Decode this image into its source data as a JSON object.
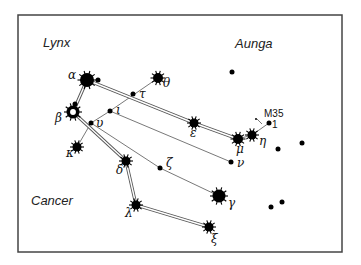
{
  "frame": {
    "x": 18,
    "y": 15,
    "w": 324,
    "h": 237,
    "stroke": "#444444"
  },
  "constellations": [
    {
      "label": "Lynx",
      "x": 43,
      "y": 47
    },
    {
      "label": "Aunga",
      "x": 235,
      "y": 48
    },
    {
      "label": "Cancer",
      "x": 31,
      "y": 205
    }
  ],
  "stars": [
    {
      "id": "theta",
      "label": "θ",
      "x": 158,
      "y": 78,
      "r": 5,
      "spiky": true,
      "lx": 163,
      "ly": 87
    },
    {
      "id": "tau",
      "label": "τ",
      "x": 133,
      "y": 94,
      "r": 2.5,
      "spiky": false,
      "lx": 139,
      "ly": 98
    },
    {
      "id": "alpha",
      "label": "α",
      "x": 87,
      "y": 80,
      "r": 7,
      "spiky": true,
      "lx": 68,
      "ly": 79
    },
    {
      "id": "alpha-companion",
      "label": "",
      "x": 98,
      "y": 80,
      "r": 2.5,
      "spiky": false
    },
    {
      "id": "alpha-beta-mid",
      "label": "",
      "x": 75,
      "y": 104,
      "r": 2.5,
      "spiky": false
    },
    {
      "id": "iota",
      "label": "ι",
      "x": 110,
      "y": 111,
      "r": 2.5,
      "spiky": false,
      "lx": 116,
      "ly": 114
    },
    {
      "id": "beta",
      "label": "β",
      "x": 73,
      "y": 112,
      "r": 6.5,
      "spiky": true,
      "hollow": true,
      "lx": 55,
      "ly": 122
    },
    {
      "id": "upsilon",
      "label": "υ",
      "x": 91,
      "y": 123,
      "r": 2.5,
      "spiky": false,
      "lx": 96,
      "ly": 127
    },
    {
      "id": "kappa",
      "label": "κ",
      "x": 77,
      "y": 147,
      "r": 4.5,
      "spiky": true,
      "lx": 66,
      "ly": 157
    },
    {
      "id": "delta",
      "label": "δ",
      "x": 126,
      "y": 161,
      "r": 4.5,
      "spiky": true,
      "lx": 116,
      "ly": 174
    },
    {
      "id": "zeta",
      "label": "ζ",
      "x": 160,
      "y": 168,
      "r": 2.5,
      "spiky": false,
      "lx": 166,
      "ly": 167
    },
    {
      "id": "epsilon",
      "label": "ε",
      "x": 194,
      "y": 123,
      "r": 4.5,
      "spiky": true,
      "lx": 190,
      "ly": 137
    },
    {
      "id": "mu",
      "label": "μ",
      "x": 238,
      "y": 139,
      "r": 5,
      "spiky": true,
      "lx": 236,
      "ly": 153
    },
    {
      "id": "eta",
      "label": "η",
      "x": 252,
      "y": 135,
      "r": 4.5,
      "spiky": true,
      "lx": 259,
      "ly": 145
    },
    {
      "id": "one",
      "label": "1",
      "x": 269,
      "y": 123,
      "r": 2.5,
      "spiky": false,
      "lx": 272,
      "ly": 128
    },
    {
      "id": "nu",
      "label": "ν",
      "x": 231,
      "y": 162,
      "r": 2.5,
      "spiky": false,
      "lx": 237,
      "ly": 167
    },
    {
      "id": "gamma",
      "label": "γ",
      "x": 219,
      "y": 196,
      "r": 6.5,
      "spiky": true,
      "lx": 228,
      "ly": 207
    },
    {
      "id": "lambda",
      "label": "λ",
      "x": 136,
      "y": 205,
      "r": 4.5,
      "spiky": true,
      "lx": 125,
      "ly": 217
    },
    {
      "id": "xi",
      "label": "ξ",
      "x": 209,
      "y": 227,
      "r": 4.5,
      "spiky": true,
      "lx": 211,
      "ly": 243
    },
    {
      "id": "field-1",
      "label": "",
      "x": 232,
      "y": 72,
      "r": 2.5,
      "spiky": false
    },
    {
      "id": "field-2",
      "label": "",
      "x": 278,
      "y": 149,
      "r": 2.5,
      "spiky": false
    },
    {
      "id": "field-3",
      "label": "",
      "x": 302,
      "y": 143,
      "r": 2.5,
      "spiky": false
    },
    {
      "id": "field-4",
      "label": "",
      "x": 271,
      "y": 207,
      "r": 2.5,
      "spiky": false
    },
    {
      "id": "field-5",
      "label": "",
      "x": 282,
      "y": 202,
      "r": 2.5,
      "spiky": false
    }
  ],
  "cluster": {
    "label": "M35",
    "x": 264,
    "y": 117,
    "dot_x": 262,
    "dot_y": 124
  },
  "double_lines": [
    [
      87,
      80,
      194,
      123
    ],
    [
      194,
      123,
      238,
      139
    ],
    [
      87,
      80,
      73,
      112
    ],
    [
      73,
      112,
      126,
      161
    ],
    [
      126,
      161,
      136,
      205
    ],
    [
      136,
      205,
      209,
      227
    ]
  ],
  "single_lines": [
    [
      158,
      78,
      110,
      111
    ],
    [
      110,
      111,
      91,
      123
    ],
    [
      91,
      123,
      77,
      147
    ],
    [
      110,
      111,
      231,
      162
    ],
    [
      91,
      123,
      160,
      168
    ],
    [
      160,
      168,
      219,
      196
    ],
    [
      238,
      139,
      252,
      135
    ],
    [
      252,
      135,
      269,
      123
    ],
    [
      262,
      124,
      257,
      119
    ]
  ]
}
